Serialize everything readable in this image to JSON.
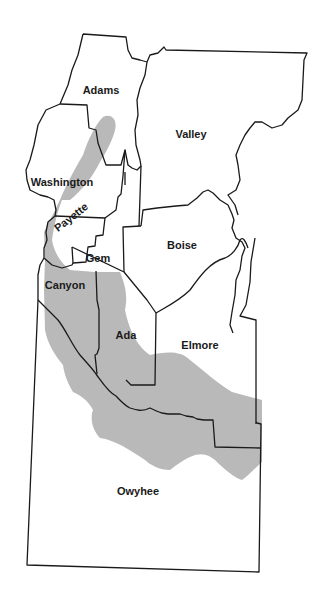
{
  "map": {
    "title": "",
    "colors": {
      "shaded_region": "#b9b9b9",
      "boundary": "#1a1a1a",
      "background": "#ffffff"
    },
    "counties": [
      {
        "id": "adams",
        "label": "Adams",
        "x": 101,
        "y": 90,
        "rotated": false
      },
      {
        "id": "valley",
        "label": "Valley",
        "x": 191,
        "y": 134,
        "rotated": false
      },
      {
        "id": "washington",
        "label": "Washington",
        "x": 62,
        "y": 182,
        "rotated": false
      },
      {
        "id": "payette",
        "label": "Payette",
        "x": 71,
        "y": 217,
        "rotated": true
      },
      {
        "id": "gem",
        "label": "Gem",
        "x": 98,
        "y": 258,
        "rotated": false
      },
      {
        "id": "boise",
        "label": "Boise",
        "x": 182,
        "y": 245,
        "rotated": false
      },
      {
        "id": "canyon",
        "label": "Canyon",
        "x": 65,
        "y": 285,
        "rotated": false
      },
      {
        "id": "ada",
        "label": "Ada",
        "x": 126,
        "y": 335,
        "rotated": false
      },
      {
        "id": "elmore",
        "label": "Elmore",
        "x": 200,
        "y": 345,
        "rotated": false
      },
      {
        "id": "owyhee",
        "label": "Owyhee",
        "x": 138,
        "y": 491,
        "rotated": false
      }
    ]
  }
}
